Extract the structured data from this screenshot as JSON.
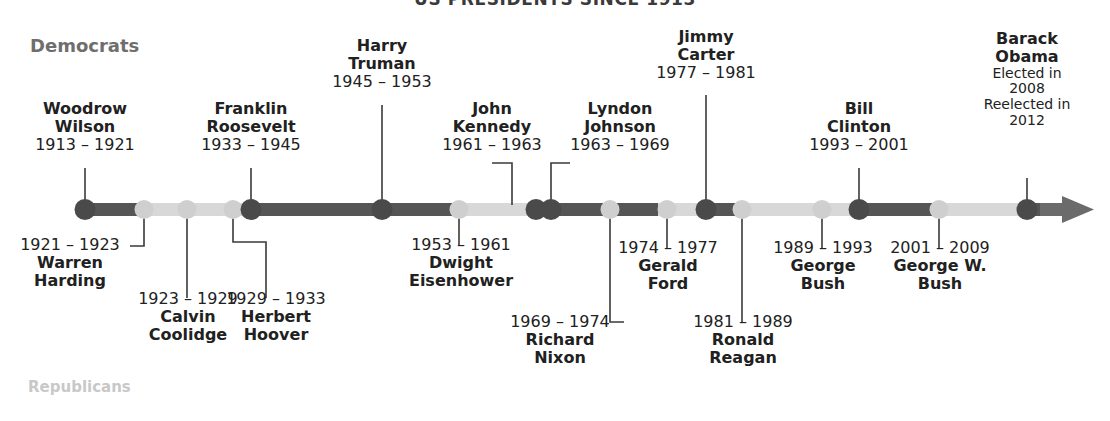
{
  "title": "US PRESIDENTS SINCE 1913",
  "legend": {
    "democrats": "Democrats",
    "republicans": "Republicans"
  },
  "colors": {
    "democrat": "#4a4a4a",
    "republican": "#cfcfcf",
    "bar_democrat": "#555555",
    "bar_republican": "#d8d8d8",
    "text": "#212121",
    "legend_democrat": "#6e6e6e",
    "legend_republican": "#c8c8c8",
    "arrow": "#6b6b6b",
    "connector": "#3a3a3a"
  },
  "axis": {
    "start_year": 1913,
    "end_year": 2016,
    "arrow": "right-arrow"
  },
  "presidents": [
    {
      "id": "wilson",
      "name": "Woodrow\nWilson",
      "first": "Woodrow",
      "last": "Wilson",
      "years": "1913 – 1921",
      "party": "democrat",
      "side": "above"
    },
    {
      "id": "harding",
      "name": "Warren\nHarding",
      "first": "Warren",
      "last": "Harding",
      "years": "1921 – 1923",
      "party": "republican",
      "side": "below"
    },
    {
      "id": "coolidge",
      "name": "Calvin\nCoolidge",
      "first": "Calvin",
      "last": "Coolidge",
      "years": "1923 – 1929",
      "party": "republican",
      "side": "below"
    },
    {
      "id": "hoover",
      "name": "Herbert\nHoover",
      "first": "Herbert",
      "last": "Hoover",
      "years": "1929 – 1933",
      "party": "republican",
      "side": "below"
    },
    {
      "id": "roosevelt",
      "name": "Franklin\nRoosevelt",
      "first": "Franklin",
      "last": "Roosevelt",
      "years": "1933 – 1945",
      "party": "democrat",
      "side": "above"
    },
    {
      "id": "truman",
      "name": "Harry\nTruman",
      "first": "Harry",
      "last": "Truman",
      "years": "1945 – 1953",
      "party": "democrat",
      "side": "above"
    },
    {
      "id": "eisenhower",
      "name": "Dwight\nEisenhower",
      "first": "Dwight",
      "last": "Eisenhower",
      "years": "1953 – 1961",
      "party": "republican",
      "side": "below"
    },
    {
      "id": "kennedy",
      "name": "John\nKennedy",
      "first": "John",
      "last": "Kennedy",
      "years": "1961 – 1963",
      "party": "democrat",
      "side": "above"
    },
    {
      "id": "johnson",
      "name": "Lyndon\nJohnson",
      "first": "Lyndon",
      "last": "Johnson",
      "years": "1963 – 1969",
      "party": "democrat",
      "side": "above"
    },
    {
      "id": "nixon",
      "name": "Richard\nNixon",
      "first": "Richard",
      "last": "Nixon",
      "years": "1969 – 1974",
      "party": "republican",
      "side": "below"
    },
    {
      "id": "ford",
      "name": "Gerald\nFord",
      "first": "Gerald",
      "last": "Ford",
      "years": "1974 – 1977",
      "party": "republican",
      "side": "below"
    },
    {
      "id": "carter",
      "name": "Jimmy\nCarter",
      "first": "Jimmy",
      "last": "Carter",
      "years": "1977 – 1981",
      "party": "democrat",
      "side": "above"
    },
    {
      "id": "reagan",
      "name": "Ronald\nReagan",
      "first": "Ronald",
      "last": "Reagan",
      "years": "1981 – 1989",
      "party": "republican",
      "side": "below"
    },
    {
      "id": "bush41",
      "name": "George\nBush",
      "first": "George",
      "last": "Bush",
      "years": "1989 – 1993",
      "party": "republican",
      "side": "below"
    },
    {
      "id": "clinton",
      "name": "Bill\nClinton",
      "first": "Bill",
      "last": "Clinton",
      "years": "1993 – 2001",
      "party": "democrat",
      "side": "above"
    },
    {
      "id": "bush43",
      "name": "George W.\nBush",
      "first": "George W.",
      "last": "Bush",
      "years": "2001 – 2009",
      "party": "republican",
      "side": "below"
    },
    {
      "id": "obama",
      "name": "Barack\nObama",
      "first": "Barack",
      "last": "Obama",
      "years": "Elected in 2008 Reelected in 2012",
      "elected": "Elected in",
      "elected_year": "2008",
      "reelected": "Reelected in",
      "reelected_year": "2012",
      "party": "democrat",
      "side": "above"
    }
  ],
  "labels": {
    "wilson": {
      "l1": "Woodrow",
      "l2": "Wilson",
      "l3": "1913 – 1921"
    },
    "harding": {
      "l1": "1921 – 1923",
      "l2": "Warren",
      "l3": "Harding"
    },
    "coolidge": {
      "l1": "1923 – 1929",
      "l2": "Calvin",
      "l3": "Coolidge"
    },
    "hoover": {
      "l1": "1929 – 1933",
      "l2": "Herbert",
      "l3": "Hoover"
    },
    "roosevelt": {
      "l1": "Franklin",
      "l2": "Roosevelt",
      "l3": "1933 – 1945"
    },
    "truman": {
      "l1": "Harry",
      "l2": "Truman",
      "l3": "1945 – 1953"
    },
    "eisenhower": {
      "l1": "1953 – 1961",
      "l2": "Dwight",
      "l3": "Eisenhower"
    },
    "kennedy": {
      "l1": "John",
      "l2": "Kennedy",
      "l3": "1961 – 1963"
    },
    "johnson": {
      "l1": "Lyndon",
      "l2": "Johnson",
      "l3": "1963 – 1969"
    },
    "nixon": {
      "l1": "1969 – 1974",
      "l2": "Richard",
      "l3": "Nixon"
    },
    "ford": {
      "l1": "1974 – 1977",
      "l2": "Gerald",
      "l3": "Ford"
    },
    "carter": {
      "l1": "Jimmy",
      "l2": "Carter",
      "l3": "1977 – 1981"
    },
    "reagan": {
      "l1": "1981 – 1989",
      "l2": "Ronald",
      "l3": "Reagan"
    },
    "bush41": {
      "l1": "1989 – 1993",
      "l2": "George",
      "l3": "Bush"
    },
    "clinton": {
      "l1": "Bill",
      "l2": "Clinton",
      "l3": "1993 – 2001"
    },
    "bush43": {
      "l1": "2001 – 2009",
      "l2": "George W.",
      "l3": "Bush"
    },
    "obama": {
      "l1": "Barack",
      "l2": "Obama",
      "l3": "Elected in",
      "l4": "2008",
      "l5": "Reelected in",
      "l6": "2012"
    }
  }
}
